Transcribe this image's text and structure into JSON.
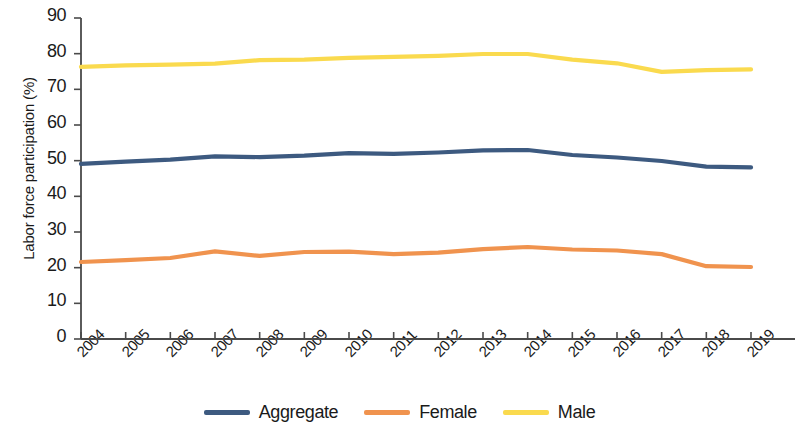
{
  "chart_data": {
    "type": "line",
    "title": "",
    "xlabel": "",
    "ylabel": "Labor force participation (%)",
    "ylim": [
      0,
      90
    ],
    "ytick_values": [
      90,
      80,
      70,
      60,
      50,
      40,
      30,
      20,
      10,
      0
    ],
    "ytick_labels": [
      "90",
      "80",
      "70",
      "60",
      "50",
      "40",
      "30",
      "20",
      "10",
      "0"
    ],
    "grid": false,
    "legend_position": "bottom",
    "categories": [
      "2004",
      "2005",
      "2006",
      "2007",
      "2008",
      "2009",
      "2010",
      "2011",
      "2012",
      "2013",
      "2014",
      "2015",
      "2016",
      "2017",
      "2018",
      "2019"
    ],
    "x": [
      2004,
      2005,
      2006,
      2007,
      2008,
      2009,
      2010,
      2011,
      2012,
      2013,
      2014,
      2015,
      2016,
      2017,
      2018,
      2019
    ],
    "series": [
      {
        "name": "Aggregate",
        "color": "#3d5a80",
        "values": [
          49.1,
          49.7,
          50.3,
          51.2,
          51.0,
          51.4,
          52.1,
          51.9,
          52.3,
          52.9,
          53.0,
          51.6,
          50.9,
          49.9,
          48.3,
          48.1
        ]
      },
      {
        "name": "Female",
        "color": "#f0934e",
        "values": [
          21.6,
          22.1,
          22.7,
          24.6,
          23.3,
          24.4,
          24.5,
          23.8,
          24.2,
          25.2,
          25.8,
          25.1,
          24.8,
          23.8,
          20.4,
          20.2
        ]
      },
      {
        "name": "Male",
        "color": "#fada4e",
        "values": [
          76.3,
          76.7,
          76.9,
          77.2,
          78.2,
          78.3,
          78.8,
          79.1,
          79.4,
          79.9,
          79.9,
          78.3,
          77.3,
          74.9,
          75.4,
          75.6
        ]
      }
    ]
  },
  "legend": {
    "items": [
      {
        "label": "Aggregate",
        "color": "#3d5a80"
      },
      {
        "label": "Female",
        "color": "#f0934e"
      },
      {
        "label": "Male",
        "color": "#fada4e"
      }
    ]
  }
}
